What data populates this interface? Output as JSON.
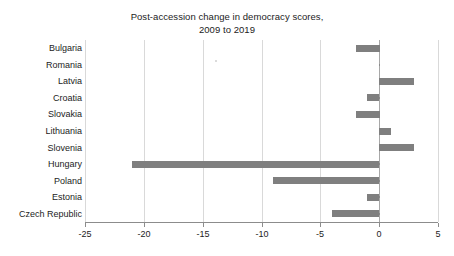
{
  "chart_data": {
    "type": "bar",
    "orientation": "horizontal",
    "title": "Post-accession change in democracy scores, 2009 to 2019",
    "title_lines": [
      "Post-accession change in democracy scores,",
      "2009 to 2019"
    ],
    "xlabel": "",
    "ylabel": "",
    "categories": [
      "Bulgaria",
      "Romania",
      "Latvia",
      "Croatia",
      "Slovakia",
      "Lithuania",
      "Slovenia",
      "Hungary",
      "Poland",
      "Estonia",
      "Czech Republic"
    ],
    "values": [
      -2,
      0,
      3,
      -1,
      -2,
      1,
      3,
      -21,
      -9,
      -1,
      -4
    ],
    "xlim": [
      -25,
      5
    ],
    "xticks": [
      -25,
      -20,
      -15,
      -10,
      -5,
      0,
      5
    ],
    "xtick_labels": [
      "-25",
      "-20",
      "-15",
      "-10",
      "-5",
      "0",
      "5"
    ],
    "grid": true,
    "grid_axis": "x",
    "legend": false,
    "bar_color": "#7f7f7f",
    "grid_color": "#d9d9d9",
    "axis_color": "#8c8c8c",
    "background_color": "#ffffff"
  }
}
